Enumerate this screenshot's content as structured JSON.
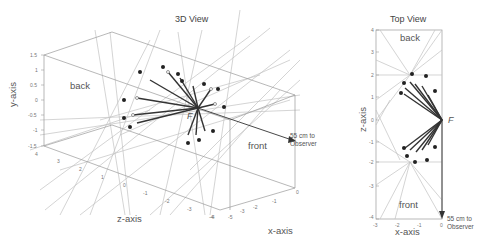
{
  "figure": {
    "panels": [
      {
        "id": "3d-view",
        "title": "3D View",
        "region_labels": {
          "back": "back",
          "front": "front"
        },
        "focus_label": "F",
        "observer_note": [
          "55 cm to",
          "Observer"
        ],
        "axes": {
          "y": {
            "label": "y-axis",
            "ticks": [
              "1.5",
              "1",
              "0.5",
              "0",
              "-0.5",
              "-1",
              "-1.5"
            ]
          },
          "z": {
            "label": "z-axis",
            "ticks": [
              "4",
              "3",
              "2",
              "1",
              "0",
              "-1",
              "-2",
              "-3",
              "-4"
            ]
          },
          "x": {
            "label": "x-axis",
            "ticks": [
              "-5",
              "-4",
              "-3",
              "-2",
              "-1",
              "0"
            ]
          }
        }
      },
      {
        "id": "top-view",
        "title": "Top View",
        "region_labels": {
          "back": "back",
          "front": "front"
        },
        "focus_label": "F",
        "observer_note": [
          "55 cm to",
          "Observer"
        ],
        "axes": {
          "z": {
            "label": "z-axis",
            "ticks": [
              "4",
              "3",
              "2",
              "1",
              "0",
              "-1",
              "-2",
              "-3",
              "-4"
            ]
          },
          "x": {
            "label": "x-axis",
            "ticks": [
              "-3",
              "-2",
              "-1",
              "0"
            ]
          }
        }
      }
    ]
  },
  "colors": {
    "thin_line": "#b8b8b8",
    "box_line": "#9a9a9a",
    "thick_line": "#333333",
    "dot": "#222222",
    "text": "#555555"
  }
}
